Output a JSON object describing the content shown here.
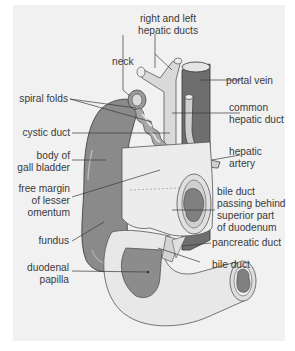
{
  "figure": {
    "type": "anatomical diagram",
    "colors": {
      "background": "#ffffff",
      "panel": "#f1f1f1",
      "gall_bladder": "#8a8a8a",
      "portal_vein": "#6e6e6e",
      "hepatic_artery": "#c9c9c9",
      "ducts": "#d9d9d9",
      "duodenum": "#e6e6e6",
      "duodenum_interior": "#909090",
      "leader_lines": "#3a3a3a",
      "label_text": "#3a3a3a"
    }
  },
  "labels": {
    "right_left_hepatic_ducts": [
      "right and left",
      "hepatic ducts"
    ],
    "neck": [
      "neck"
    ],
    "portal_vein": [
      "portal vein"
    ],
    "spiral_folds": [
      "spiral folds"
    ],
    "common_hepatic_duct": [
      "common",
      "hepatic duct"
    ],
    "cystic_duct": [
      "cystic duct"
    ],
    "body_of_gall_bladder": [
      "body of",
      "gall bladder"
    ],
    "hepatic_artery": [
      "hepatic",
      "artery"
    ],
    "free_margin": [
      "free margin",
      "of lesser",
      "omentum"
    ],
    "bile_duct_behind": [
      "bile duct",
      "passing behind",
      "superior part",
      "of duodenum"
    ],
    "fundus": [
      "fundus"
    ],
    "pancreatic_duct": [
      "pancreatic duct"
    ],
    "duodenal_papilla": [
      "duodenal",
      "papilla"
    ],
    "bile_duct": [
      "bile duct"
    ]
  }
}
